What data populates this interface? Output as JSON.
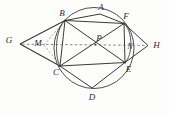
{
  "figure": {
    "type": "geometry-diagram",
    "width": 169,
    "height": 114,
    "background_color": "#fdfdfc",
    "stroke_color": "#3a3a3a",
    "dashed_color": "#6a6a6a",
    "label_color": "#2a2a2a"
  },
  "points": [
    {
      "id": "A",
      "label": "A",
      "x": 100.0,
      "y": 14.0,
      "label_x": 101.0,
      "label_y": 6.5,
      "on_circle": true
    },
    {
      "id": "B",
      "label": "B",
      "x": 65.0,
      "y": 20.5,
      "label_x": 62.0,
      "label_y": 13.0,
      "on_circle": true
    },
    {
      "id": "C",
      "label": "C",
      "x": 60.0,
      "y": 66.0,
      "label_x": 56.0,
      "label_y": 72.0,
      "on_circle": true
    },
    {
      "id": "D",
      "label": "D",
      "x": 92.0,
      "y": 88.0,
      "label_x": 92.0,
      "label_y": 97.0,
      "on_circle": true
    },
    {
      "id": "E",
      "label": "E",
      "x": 125.0,
      "y": 62.5,
      "label_x": 128.5,
      "label_y": 68.5,
      "on_circle": true
    },
    {
      "id": "F",
      "label": "F",
      "x": 124.0,
      "y": 23.5,
      "label_x": 126.0,
      "label_y": 16.0,
      "on_circle": true
    },
    {
      "id": "G",
      "label": "G",
      "x": 20.0,
      "y": 44.0,
      "label_x": 9.0,
      "label_y": 39.5,
      "on_circle": false
    },
    {
      "id": "H",
      "label": "H",
      "x": 148.0,
      "y": 45.5,
      "label_x": 156.5,
      "label_y": 44.5,
      "on_circle": false
    },
    {
      "id": "P",
      "label": "P",
      "x": 95.5,
      "y": 44.5,
      "label_x": 99.0,
      "label_y": 37.5,
      "on_circle": false
    },
    {
      "id": "M",
      "label": "M",
      "x": 44.0,
      "y": 45.0,
      "label_x": 38.0,
      "label_y": 42.5,
      "on_circle": false
    },
    {
      "id": "N",
      "label": "N",
      "x": 128.5,
      "y": 47.5,
      "label_x": 130.0,
      "label_y": 46.0,
      "on_circle": false
    }
  ],
  "circle": {
    "center_x": 94.0,
    "center_y": 48.0,
    "radius_x": 40.0,
    "radius_y": 40.5,
    "rotation_deg": 0
  },
  "segments": [
    {
      "id": "AB",
      "from": "B",
      "to": "A",
      "style": "solid"
    },
    {
      "id": "AF",
      "from": "A",
      "to": "F",
      "style": "solid"
    },
    {
      "id": "BF",
      "from": "B",
      "to": "F",
      "style": "solid"
    },
    {
      "id": "BC",
      "from": "B",
      "to": "C",
      "style": "solid"
    },
    {
      "id": "BE",
      "from": "B",
      "to": "E",
      "style": "solid"
    },
    {
      "id": "CF",
      "from": "C",
      "to": "F",
      "style": "solid"
    },
    {
      "id": "CE",
      "from": "C",
      "to": "E",
      "style": "solid"
    },
    {
      "id": "CD",
      "from": "C",
      "to": "D",
      "style": "solid"
    },
    {
      "id": "DE",
      "from": "D",
      "to": "E",
      "style": "solid"
    },
    {
      "id": "EF",
      "from": "E",
      "to": "F",
      "style": "solid"
    },
    {
      "id": "GB",
      "from": "G",
      "to": "B",
      "style": "solid"
    },
    {
      "id": "GC",
      "from": "G",
      "to": "C",
      "style": "solid"
    },
    {
      "id": "HF",
      "from": "H",
      "to": "F",
      "style": "solid"
    },
    {
      "id": "HE",
      "from": "H",
      "to": "E",
      "style": "solid"
    },
    {
      "id": "GH",
      "from": "G",
      "to": "H",
      "style": "dashed"
    },
    {
      "id": "MB",
      "from": "M",
      "to": "B",
      "style": "dashed"
    },
    {
      "id": "MC",
      "from": "M",
      "to": "C",
      "style": "dashed"
    }
  ],
  "arcs": [
    {
      "id": "arc-BC",
      "from": "B",
      "to": "C",
      "note": "minor arc left, bulges left"
    },
    {
      "id": "arc-FE",
      "from": "F",
      "to": "E",
      "note": "minor arc right, bulges right"
    }
  ],
  "labels_visible": [
    "A",
    "B",
    "C",
    "D",
    "E",
    "F",
    "G",
    "H",
    "P",
    "M",
    "N"
  ]
}
